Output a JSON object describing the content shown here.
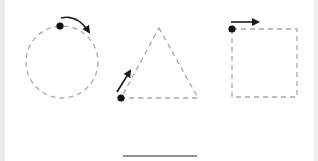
{
  "diagram": {
    "title": "",
    "colors": {
      "background": "#ffffff",
      "dashed_outline": "#a8a8a8",
      "marker": "#111111",
      "arrow": "#1a1a1a",
      "baseline": "#6e6e6e",
      "edge_strip": "#ececec"
    },
    "shapes": [
      {
        "id": "circle",
        "type": "circle",
        "style": "dashed",
        "center": [
          62,
          62
        ],
        "radius": 36,
        "start_dot": [
          60,
          26
        ],
        "arrow": {
          "kind": "curved",
          "from": [
            61,
            18
          ],
          "to": [
            89,
            32
          ],
          "direction": "clockwise"
        }
      },
      {
        "id": "triangle",
        "type": "triangle",
        "style": "dashed",
        "points": [
          [
            159,
            28
          ],
          [
            198,
            98
          ],
          [
            121,
            98
          ]
        ],
        "start_dot": [
          121,
          98
        ],
        "arrow": {
          "kind": "straight",
          "from": [
            117,
            92
          ],
          "to": [
            130,
            71
          ],
          "direction": "up-along-left-edge"
        }
      },
      {
        "id": "square",
        "type": "square",
        "style": "dashed",
        "rect": {
          "x": 232,
          "y": 29,
          "width": 65,
          "height": 68
        },
        "start_dot": [
          232,
          29
        ],
        "arrow": {
          "kind": "straight",
          "from": [
            231,
            22
          ],
          "to": [
            258,
            22
          ],
          "direction": "right"
        }
      }
    ],
    "baseline": {
      "from": [
        123,
        156
      ],
      "to": [
        197,
        156
      ]
    }
  }
}
